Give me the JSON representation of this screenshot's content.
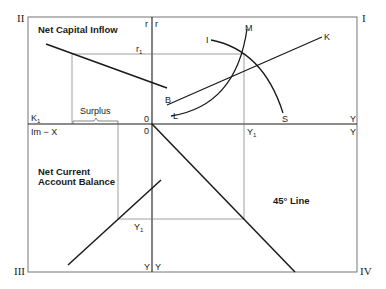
{
  "diagram": {
    "quadrant_labels": {
      "q1": "I",
      "q2": "II",
      "q3": "III",
      "q4": "IV"
    },
    "titles": {
      "net_capital_inflow": "Net Capital Inflow",
      "net_current_account_line1": "Net Current",
      "net_current_account_line2": "Account Balance",
      "forty_five_line": "45° Line"
    },
    "axis_labels": {
      "r_left": "r",
      "r_right": "r",
      "r1": "r",
      "r1_sub": "1",
      "k1": "K",
      "k1_sub": "1",
      "im_minus_x": "Im − X",
      "origin_top": "0",
      "origin_bottom": "0",
      "y_top_right": "Y",
      "y_bottom_right": "Y",
      "y1_axis": "Y",
      "y1_axis_sub": "1",
      "y1_q3": "Y",
      "y1_q3_sub": "1",
      "y_bottom_left": "Y",
      "y_bottom_right2": "Y"
    },
    "curve_labels": {
      "I": "I",
      "M": "M",
      "K": "K",
      "B": "B",
      "L": "L",
      "S": "S"
    },
    "annotations": {
      "surplus": "Surplus"
    },
    "colors": {
      "line": "#1a1a1a",
      "frame": "#555555",
      "guide": "#777777"
    }
  }
}
